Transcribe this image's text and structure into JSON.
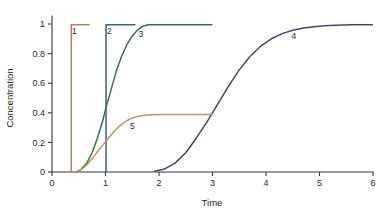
{
  "chart_data": {
    "type": "line",
    "title": "",
    "xlabel": "Time",
    "ylabel": "Concentration",
    "xlim": [
      0,
      6
    ],
    "ylim": [
      0,
      1
    ],
    "grid": false,
    "legend": "inline-labels",
    "xticks": [
      "0",
      "1",
      "2",
      "3",
      "4",
      "5",
      "6"
    ],
    "xtick_values": [
      0,
      1,
      2,
      3,
      4,
      5,
      6
    ],
    "yticks": [
      "0",
      "0.2",
      "0.4",
      "0.6",
      "0.8",
      "1"
    ],
    "ytick_values": [
      0,
      0.2,
      0.4,
      0.6,
      0.8,
      1
    ],
    "series": [
      {
        "name": "1",
        "label": "1",
        "color": "#c07a5e",
        "label_x": 0.42,
        "label_y": 0.93,
        "description": "instantaneous step to 1 at t=0.36",
        "points": [
          [
            0.36,
            0
          ],
          [
            0.36,
            0.995
          ],
          [
            0.7,
            0.995
          ]
        ]
      },
      {
        "name": "2",
        "label": "2",
        "color": "#3c6087",
        "label_x": 1.07,
        "label_y": 0.93,
        "description": "instantaneous step to 1 at t=1.01",
        "points": [
          [
            1.01,
            0
          ],
          [
            1.01,
            0.995
          ],
          [
            1.56,
            0.995
          ]
        ]
      },
      {
        "name": "3",
        "label": "3",
        "color": "#3f6d4c",
        "label_x": 1.66,
        "label_y": 0.915,
        "description": "sigmoidal rise from t=0.45 saturating at 1 near t=1.8",
        "points": [
          [
            0.46,
            0
          ],
          [
            0.55,
            0.02
          ],
          [
            0.65,
            0.06
          ],
          [
            0.75,
            0.13
          ],
          [
            0.85,
            0.23
          ],
          [
            0.95,
            0.35
          ],
          [
            1.02,
            0.45
          ],
          [
            1.1,
            0.55
          ],
          [
            1.2,
            0.68
          ],
          [
            1.3,
            0.78
          ],
          [
            1.4,
            0.86
          ],
          [
            1.5,
            0.92
          ],
          [
            1.6,
            0.96
          ],
          [
            1.7,
            0.985
          ],
          [
            1.8,
            0.995
          ],
          [
            2.0,
            0.995
          ],
          [
            2.5,
            0.995
          ],
          [
            3.0,
            0.995
          ]
        ]
      },
      {
        "name": "4",
        "label": "4",
        "color": "#4a4468",
        "label_x": 4.52,
        "label_y": 0.9,
        "description": "slow sigmoidal rise from t=1.9 saturating at 1 near t=5.6",
        "points": [
          [
            1.9,
            0.003
          ],
          [
            2.1,
            0.02
          ],
          [
            2.3,
            0.06
          ],
          [
            2.5,
            0.13
          ],
          [
            2.7,
            0.23
          ],
          [
            2.9,
            0.34
          ],
          [
            3.1,
            0.46
          ],
          [
            3.3,
            0.58
          ],
          [
            3.5,
            0.69
          ],
          [
            3.7,
            0.78
          ],
          [
            3.9,
            0.85
          ],
          [
            4.1,
            0.9
          ],
          [
            4.3,
            0.935
          ],
          [
            4.5,
            0.958
          ],
          [
            4.7,
            0.973
          ],
          [
            4.9,
            0.982
          ],
          [
            5.1,
            0.988
          ],
          [
            5.3,
            0.992
          ],
          [
            5.6,
            0.995
          ],
          [
            6.0,
            0.995
          ]
        ]
      },
      {
        "name": "5",
        "label": "5",
        "color": "#c09464",
        "label_x": 1.5,
        "label_y": 0.29,
        "description": "saturating rise from t=0.47 plateauing at 0.39",
        "points": [
          [
            0.47,
            0
          ],
          [
            0.58,
            0.025
          ],
          [
            0.68,
            0.06
          ],
          [
            0.78,
            0.105
          ],
          [
            0.88,
            0.15
          ],
          [
            0.98,
            0.195
          ],
          [
            1.08,
            0.24
          ],
          [
            1.18,
            0.282
          ],
          [
            1.28,
            0.315
          ],
          [
            1.38,
            0.343
          ],
          [
            1.48,
            0.362
          ],
          [
            1.58,
            0.374
          ],
          [
            1.7,
            0.382
          ],
          [
            1.85,
            0.387
          ],
          [
            2.1,
            0.389
          ],
          [
            2.5,
            0.389
          ],
          [
            3.0,
            0.389
          ]
        ]
      }
    ]
  },
  "axes": {
    "x_title": "Time",
    "y_title": "Concentration"
  }
}
